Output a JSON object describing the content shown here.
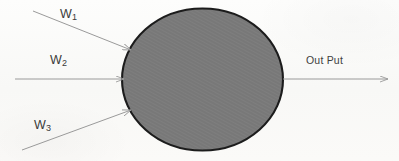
{
  "diagram": {
    "background_color": "#fbfbf9",
    "node": {
      "name": "neuron-body",
      "shape": "ellipse",
      "fill_color": "#787878",
      "stroke_color": "#1c1c1c",
      "cx": 202.5,
      "cy": 79.5,
      "rx": 80.5,
      "ry": 71.0
    },
    "stroke_color": "#9a9a9a",
    "inputs": [
      {
        "id": "w1",
        "label_text": "W",
        "subscript": "1",
        "arrow_name": "input-arrow-w1",
        "from": [
          33,
          11
        ],
        "to": [
          131,
          50
        ]
      },
      {
        "id": "w2",
        "label_text": "W",
        "subscript": "2",
        "arrow_name": "input-arrow-w2",
        "from": [
          15,
          79
        ],
        "to": [
          123,
          79
        ]
      },
      {
        "id": "w3",
        "label_text": "W",
        "subscript": "3",
        "arrow_name": "input-arrow-w3",
        "from": [
          22,
          150
        ],
        "to": [
          131,
          110
        ]
      }
    ],
    "output": {
      "id": "out",
      "label_text": "Out Put",
      "arrow_name": "output-arrow",
      "from": [
        283,
        79
      ],
      "to": [
        388,
        79
      ]
    }
  }
}
